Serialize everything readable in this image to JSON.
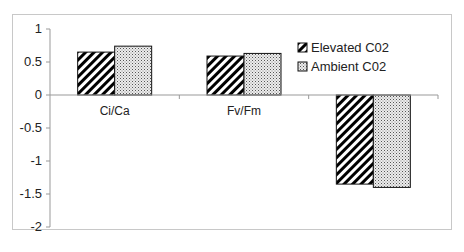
{
  "chart_data": {
    "type": "bar",
    "title": "",
    "xlabel": "",
    "ylabel": "",
    "categories": [
      "Ci/Ca",
      "Fv/Fm",
      ""
    ],
    "series": [
      {
        "name": "Elevated C02",
        "pattern": "diagonal-stripes",
        "values": [
          0.65,
          0.59,
          -1.35
        ]
      },
      {
        "name": "Ambient C02",
        "pattern": "dots",
        "values": [
          0.74,
          0.63,
          -1.4
        ]
      }
    ],
    "ylim": [
      -2,
      1
    ],
    "yticks": [
      1,
      0.5,
      0,
      -0.5,
      -1,
      -1.5,
      -2
    ],
    "ytick_labels": [
      "1",
      "0.5",
      "0",
      "-0.5",
      "-1",
      "-1.5",
      "-2"
    ],
    "grid": false,
    "legend_position": "upper right"
  },
  "colors": {
    "bar_outline": "#111111",
    "stripe": "#000000",
    "dot_fill": "#e6e6e6",
    "dot": "#555555",
    "axis": "#999999",
    "frame": "#c8c8c8"
  }
}
